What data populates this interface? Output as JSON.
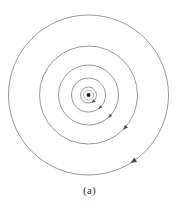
{
  "figure": {
    "caption": "(a)",
    "background_color": "#ffffff",
    "stroke_color": "#6b6b6b",
    "center_dot_color": "#1a1a1a",
    "center": {
      "x": 88.5,
      "y": 95.0
    }
  },
  "chart_data": {
    "type": "scatter",
    "title": "",
    "subtitle": "",
    "xlabel": "",
    "ylabel": "",
    "grid": false,
    "legend_position": "none",
    "annotations": [
      "(a)"
    ],
    "center_point": {
      "x": 88.5,
      "y": 95.0,
      "radius": 2.0,
      "label": "center"
    },
    "orbits": [
      {
        "name": "orbit-1-innermost",
        "radius": 8.0,
        "stroke_width": 0.7,
        "arrow_angle_deg": 55,
        "direction": "clockwise"
      },
      {
        "name": "orbit-2",
        "radius": 17.0,
        "stroke_width": 0.7,
        "arrow_angle_deg": 48,
        "direction": "clockwise"
      },
      {
        "name": "orbit-3",
        "radius": 30.0,
        "stroke_width": 0.7,
        "arrow_angle_deg": 45,
        "direction": "clockwise"
      },
      {
        "name": "orbit-4",
        "radius": 49.0,
        "stroke_width": 0.7,
        "arrow_angle_deg": 42,
        "direction": "clockwise"
      },
      {
        "name": "orbit-5-outermost",
        "radius": 80.0,
        "stroke_width": 0.7,
        "arrow_angle_deg": 56,
        "direction": "clockwise"
      }
    ],
    "ring_halo": {
      "radius": 5.0,
      "stroke_width": 0.6
    }
  }
}
